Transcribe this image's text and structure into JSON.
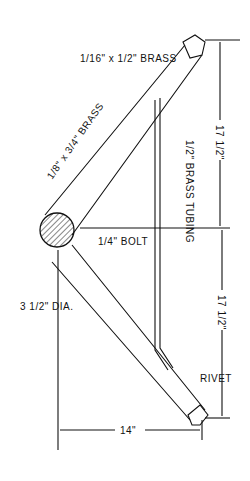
{
  "diagram": {
    "type": "technical drawing",
    "labels": {
      "top_strap": "1/16\" x 1/2\" BRASS",
      "upper_strap": "1/8\" x 3/4\" BRASS",
      "tubing": "1/2\" BRASS TUBING",
      "bolt": "1/4\" BOLT",
      "hub_dia": "3 1/2\" DIA.",
      "upper_dim": "17 1/2\"",
      "lower_dim": "17 1/2\"",
      "width_dim": "14\"",
      "rivet": "RIVET"
    },
    "colors": {
      "ink": "#111111",
      "paper": "#ffffff"
    }
  }
}
